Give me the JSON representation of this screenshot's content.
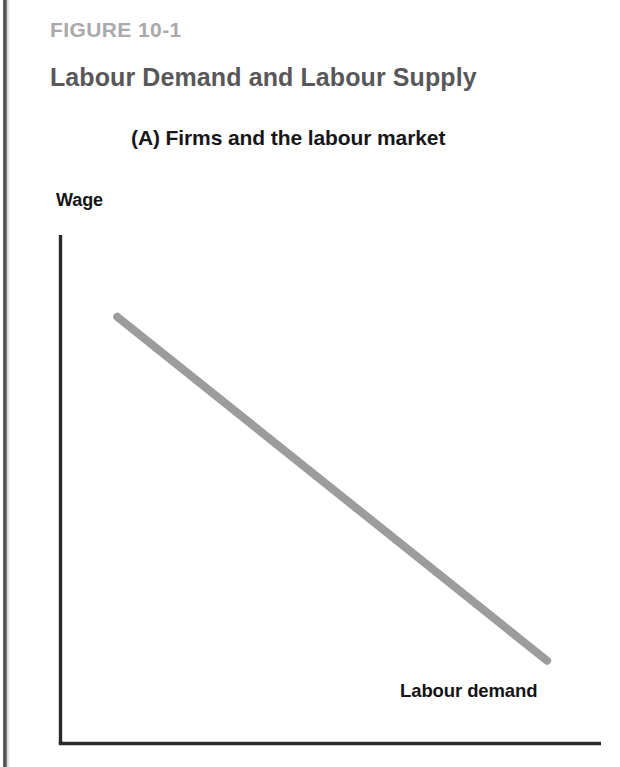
{
  "figure": {
    "number_label": "FIGURE 10-1",
    "title": "Labour Demand and Labour Supply",
    "panel_title": "(A) Firms and the labour market"
  },
  "colors": {
    "figure_number": "#a9a9ab",
    "title": "#58585a",
    "panel_title": "#17171a",
    "axis": "#2a2a2c",
    "demand_curve": "#9c9c9c",
    "background": "#ffffff",
    "gutter": "#3d3d3f"
  },
  "chart_data": {
    "type": "line",
    "title": "(A) Firms and the labour market",
    "xlabel": "",
    "ylabel": "Wage",
    "xlim": [
      0,
      100
    ],
    "ylim": [
      0,
      100
    ],
    "grid": false,
    "legend_position": "inline-annotation",
    "axes": {
      "y_axis_label": "Wage",
      "x_axis_label": "",
      "ticks_shown": false,
      "tick_labels": []
    },
    "series": [
      {
        "name": "Labour demand",
        "color": "#9c9c9c",
        "x": [
          10.5,
          90.0
        ],
        "y": [
          83.9,
          16.3
        ],
        "annotation": "Labour demand",
        "description": "Downward-sloping straight labour demand curve"
      }
    ],
    "annotations": [
      {
        "text": "Labour demand",
        "x": 63.0,
        "y": 12.4
      },
      {
        "text": "Wage",
        "x": 0.0,
        "y": 104.0
      }
    ]
  }
}
